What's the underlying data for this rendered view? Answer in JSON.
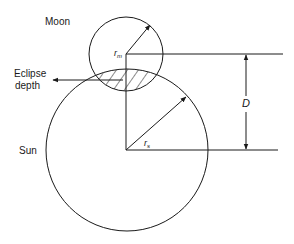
{
  "diagram": {
    "labels": {
      "moon": "Moon",
      "sun": "Sun",
      "eclipse_line1": "Eclipse",
      "eclipse_line2": "depth",
      "moon_radius": "r",
      "moon_radius_sub": "m",
      "sun_radius": "r",
      "sun_radius_sub": "s",
      "distance": "D"
    },
    "shapes": {
      "moon": {
        "cx": 126,
        "cy": 54,
        "r": 37
      },
      "sun": {
        "cx": 127,
        "cy": 150,
        "r": 81
      }
    },
    "colors": {
      "stroke": "#1a1a1a",
      "background": "#ffffff"
    }
  }
}
